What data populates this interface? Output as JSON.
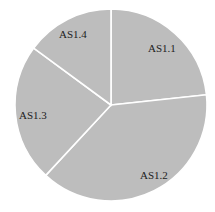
{
  "chart_data": {
    "type": "pie",
    "title": "",
    "categories": [
      "AS1.1",
      "AS1.2",
      "AS1.3",
      "AS1.4"
    ],
    "values": [
      23.3,
      38.6,
      23.2,
      14.9
    ],
    "start_angle": "12 o'clock, clockwise",
    "colors": {
      "slice_fill": "#bdbdbd",
      "separator": "#ffffff",
      "label": "#222222"
    },
    "legend": "none",
    "labels_position": "inside"
  },
  "labels": [
    "AS1.1",
    "AS1.2",
    "AS1.3",
    "AS1.4"
  ]
}
